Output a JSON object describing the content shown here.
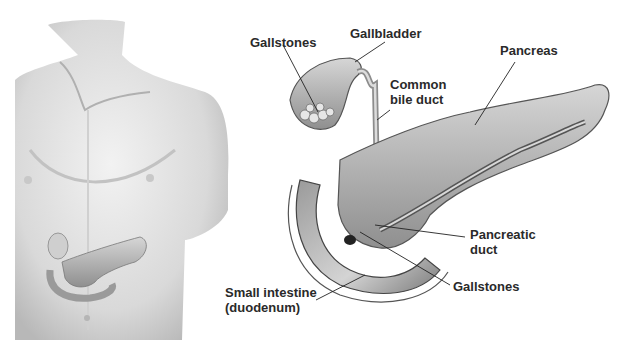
{
  "figure": {
    "left_panel": {
      "subject": "male torso showing pancreas location"
    },
    "labels": {
      "gallstones_top": {
        "text": "Gallstones"
      },
      "gallbladder": {
        "text": "Gallbladder"
      },
      "common_bile_duct": {
        "line1": "Common",
        "line2": "bile duct"
      },
      "pancreas": {
        "text": "Pancreas"
      },
      "pancreatic_duct": {
        "line1": "Pancreatic",
        "line2": "duct"
      },
      "gallstones_bottom": {
        "text": "Gallstones"
      },
      "small_intestine": {
        "line1": "Small intestine",
        "line2": "(duodenum)"
      }
    },
    "colors": {
      "background": "#ffffff",
      "label_text": "#2a2a2a",
      "leader_line": "#222222",
      "skin_light": "#e8e8e8",
      "skin_shadow": "#a9a9a9",
      "organ": "#bdbdbd"
    }
  }
}
